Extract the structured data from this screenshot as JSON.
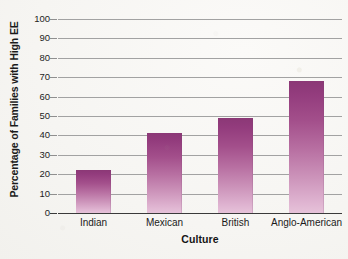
{
  "chart_data": {
    "type": "bar",
    "title": "",
    "subtitle": "",
    "xlabel": "Culture",
    "ylabel": "Percentage of Families with High EE",
    "categories": [
      "Indian",
      "Mexican",
      "British",
      "Anglo-American"
    ],
    "values": [
      22,
      41,
      49,
      68
    ],
    "series": [
      {
        "name": "Percentage of Families with High EE",
        "values": [
          22,
          41,
          49,
          68
        ]
      }
    ],
    "ylim": [
      0,
      100
    ],
    "ytick_labels": [
      "100",
      "90",
      "80",
      "70",
      "60",
      "50",
      "40",
      "30",
      "20",
      "10",
      "0"
    ],
    "ytick_values": [
      100,
      90,
      80,
      70,
      60,
      50,
      40,
      30,
      20,
      10,
      0
    ],
    "ytick_interval": 10,
    "grid": true,
    "grid_axis": "y",
    "legend": false,
    "legend_position": "none",
    "bar_color_top": "#8b3876",
    "bar_color_bottom": "#e6c2d9",
    "gridline_color": "#a2a2a2",
    "axis_color": "#3a3a3a",
    "background_color": "#f7f6f3",
    "text_color": "#1b1b1b"
  }
}
